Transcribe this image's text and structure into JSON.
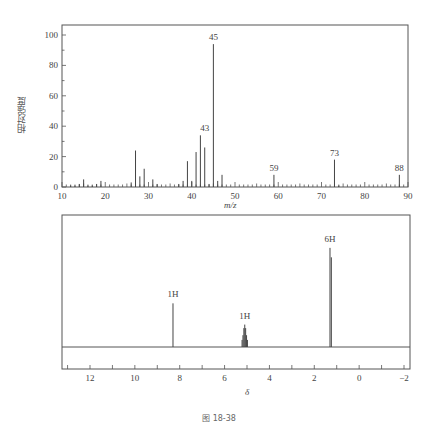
{
  "chart_data": [
    {
      "type": "bar",
      "title": "Mass spectrum",
      "xlabel": "m/z",
      "ylabel": "相对强度",
      "xlim": [
        10,
        90
      ],
      "ylim": [
        0,
        105
      ],
      "xticks": [
        10,
        20,
        30,
        40,
        50,
        60,
        70,
        80,
        90
      ],
      "yticks": [
        0,
        20,
        40,
        60,
        80,
        100
      ],
      "grid": false,
      "peaks": [
        {
          "x": 12,
          "y": 1
        },
        {
          "x": 13,
          "y": 1
        },
        {
          "x": 14,
          "y": 2
        },
        {
          "x": 15,
          "y": 5
        },
        {
          "x": 16,
          "y": 1
        },
        {
          "x": 17,
          "y": 1
        },
        {
          "x": 18,
          "y": 2
        },
        {
          "x": 19,
          "y": 4
        },
        {
          "x": 26,
          "y": 3
        },
        {
          "x": 27,
          "y": 24
        },
        {
          "x": 28,
          "y": 7
        },
        {
          "x": 29,
          "y": 12
        },
        {
          "x": 31,
          "y": 5
        },
        {
          "x": 32,
          "y": 2
        },
        {
          "x": 37,
          "y": 2
        },
        {
          "x": 38,
          "y": 4
        },
        {
          "x": 39,
          "y": 17
        },
        {
          "x": 40,
          "y": 4
        },
        {
          "x": 41,
          "y": 23
        },
        {
          "x": 42,
          "y": 34
        },
        {
          "x": 43,
          "y": 26
        },
        {
          "x": 44,
          "y": 2
        },
        {
          "x": 45,
          "y": 94
        },
        {
          "x": 46,
          "y": 4
        },
        {
          "x": 47,
          "y": 8
        },
        {
          "x": 59,
          "y": 8
        },
        {
          "x": 73,
          "y": 18
        },
        {
          "x": 74,
          "y": 1
        },
        {
          "x": 88,
          "y": 8
        }
      ],
      "annotations": [
        {
          "x": 43,
          "y": 34,
          "text": "43"
        },
        {
          "x": 45,
          "y": 94,
          "text": "45"
        },
        {
          "x": 59,
          "y": 8,
          "text": "59"
        },
        {
          "x": 73,
          "y": 18,
          "text": "73"
        },
        {
          "x": 88,
          "y": 8,
          "text": "88"
        }
      ]
    },
    {
      "type": "line",
      "title": "1H NMR spectrum",
      "xlabel": "δ",
      "ylabel": "",
      "xlim": [
        13.25,
        -2.3
      ],
      "xticks": [
        12,
        10,
        8,
        6,
        4,
        2,
        0,
        -2
      ],
      "xticks_minor": [
        13,
        11,
        9,
        7,
        5,
        3,
        1,
        -1
      ],
      "grid": false,
      "signals": [
        {
          "delta": 8.3,
          "integration": "1H",
          "multiplicity": "singlet",
          "lines": [
            {
              "d": 8.3,
              "h": 0.37
            }
          ]
        },
        {
          "delta": 5.1,
          "integration": "1H",
          "multiplicity": "septet",
          "lines": [
            {
              "d": 5.22,
              "h": 0.06
            },
            {
              "d": 5.18,
              "h": 0.1
            },
            {
              "d": 5.14,
              "h": 0.16
            },
            {
              "d": 5.1,
              "h": 0.19
            },
            {
              "d": 5.06,
              "h": 0.16
            },
            {
              "d": 5.02,
              "h": 0.1
            },
            {
              "d": 4.98,
              "h": 0.06
            }
          ]
        },
        {
          "delta": 1.27,
          "integration": "6H",
          "multiplicity": "doublet",
          "lines": [
            {
              "d": 1.3,
              "h": 0.84
            },
            {
              "d": 1.24,
              "h": 0.76
            }
          ]
        }
      ],
      "annotations": [
        {
          "delta": 8.3,
          "text": "1H"
        },
        {
          "delta": 5.1,
          "text": "1H"
        },
        {
          "delta": 1.3,
          "text": "6H"
        }
      ]
    }
  ],
  "ms": {
    "ylabel": "相对强度",
    "xlabel": "m/z"
  },
  "nmr": {
    "xlabel": "δ"
  },
  "caption": "图 18-38"
}
